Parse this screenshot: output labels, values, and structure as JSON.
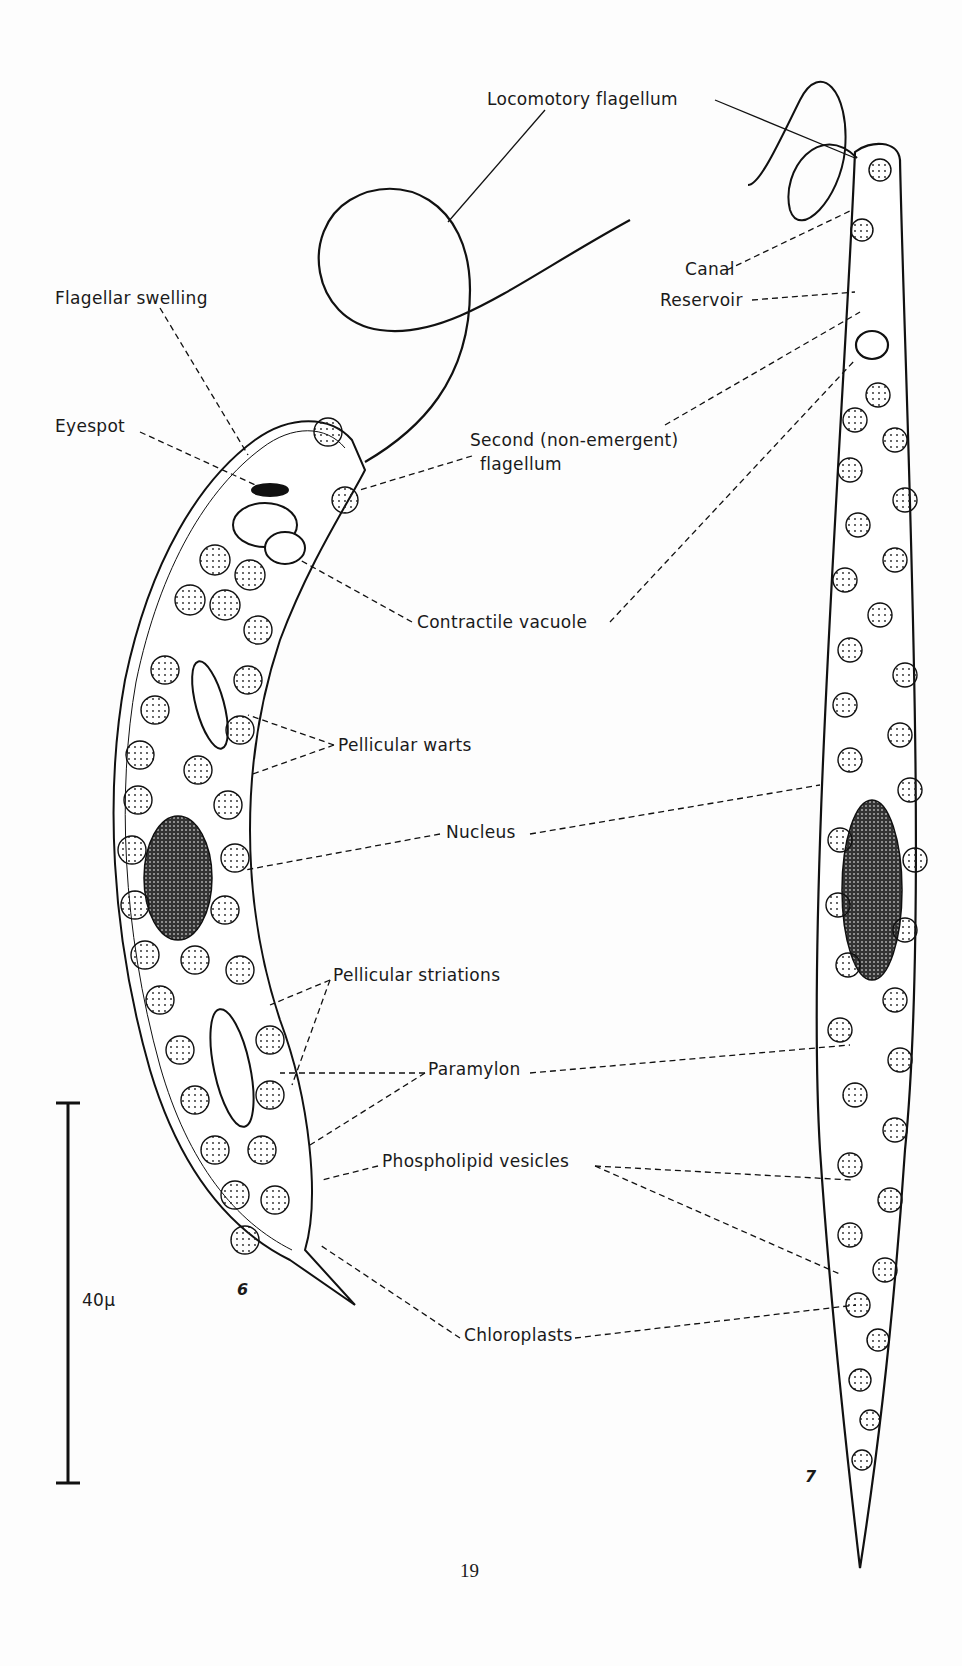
{
  "figure": {
    "page_number": "19",
    "figure_numbers": [
      "6",
      "7"
    ],
    "scale_bar": {
      "label": "40μ"
    },
    "labels": {
      "locomotory_flagellum": "Locomotory flagellum",
      "flagellar_swelling": "Flagellar swelling",
      "eyespot": "Eyespot",
      "second_flagellum_line1": "Second (non-emergent)",
      "second_flagellum_line2": "flagellum",
      "canal": "Canal",
      "reservoir": "Reservoir",
      "contractile_vacuole": "Contractile vacuole",
      "pellicular_warts": "Pellicular warts",
      "nucleus": "Nucleus",
      "pellicular_striations": "Pellicular striations",
      "paramylon": "Paramylon",
      "phospholipid_vesicles": "Phospholipid vesicles",
      "chloroplasts": "Chloroplasts"
    }
  }
}
